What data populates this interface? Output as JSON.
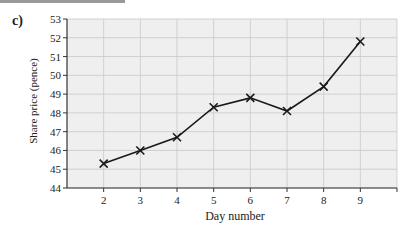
{
  "figure_label": "c)",
  "chart_data": {
    "type": "line",
    "title": "",
    "xlabel": "Day number",
    "ylabel": "Share price (pence)",
    "x": [
      2,
      3,
      4,
      5,
      6,
      7,
      8,
      9
    ],
    "series": [
      {
        "name": "Share price",
        "values": [
          45.3,
          46.0,
          46.7,
          48.3,
          48.8,
          48.1,
          49.4,
          51.8
        ],
        "marker": "x"
      }
    ],
    "xlim": [
      1,
      10
    ],
    "ylim": [
      44,
      53
    ],
    "xticks": [
      2,
      3,
      4,
      5,
      6,
      7,
      8,
      9
    ],
    "yticks": [
      44,
      45,
      46,
      47,
      48,
      49,
      50,
      51,
      52,
      53
    ],
    "grid": true,
    "legend": "none"
  },
  "colors": {
    "plot_bg": "#efefef",
    "grid": "#c8c8c8",
    "line": "#1a1a1a"
  }
}
